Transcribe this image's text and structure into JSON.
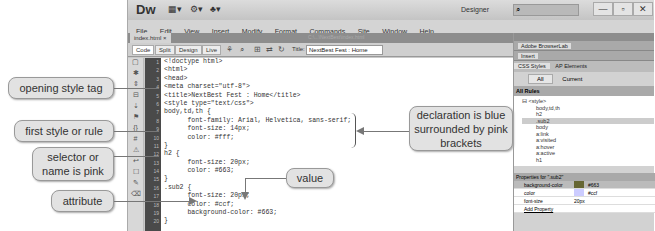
{
  "app": {
    "logo": "Dw",
    "workspace": "Designer",
    "search_placeholder": "",
    "window_controls": [
      "—",
      "▫",
      "✕"
    ]
  },
  "menu": [
    "File",
    "Edit",
    "View",
    "Insert",
    "Modify",
    "Format",
    "Commands",
    "Site",
    "Window",
    "Help"
  ],
  "document": {
    "tab": "index.html ×",
    "path": "C:\\...\\NextBest\\index.html",
    "views": [
      "Code",
      "Split",
      "Design",
      "Live"
    ],
    "title_label": "Title:",
    "title_value": "NextBest Fest : Home"
  },
  "code_lines": [
    "<!doctype html>",
    "<html>",
    "<head>",
    "<meta charset=\"utf-8\">",
    "<title>NextBest Fest : Home</title>",
    "<style type=\"text/css\">",
    "body,td,th {",
    "      font-family: Arial, Helvetica, sans-serif;",
    "      font-size: 14px;",
    "      color: #fff;",
    "}",
    "h2 {",
    "      font-size: 20px;",
    "      color: #663;",
    "}",
    ".sub2 {",
    "      font-size: 20px;",
    "      color: #ccf;",
    "      background-color: #663;",
    "}"
  ],
  "line_numbers": [
    "1",
    "2",
    "3",
    "4",
    "5",
    "6",
    "7",
    "8",
    "9",
    "10",
    "11",
    "12",
    "13",
    "14",
    "15",
    "16",
    "17",
    "18",
    "19",
    "20"
  ],
  "panels": {
    "browserlab": "Adobe BrowserLab",
    "insert": "Insert",
    "tabs": [
      "CSS Styles",
      "AP Elements"
    ],
    "mode_buttons": [
      "All",
      "Current"
    ],
    "rules_header": "All Rules",
    "rules": [
      "⊟ <style>",
      "body,td,th",
      "h2",
      ".sub2",
      "body",
      "a:link",
      "a:visited",
      "a:hover",
      "a:active",
      "h1"
    ],
    "props_header": "Properties for \".sub2\"",
    "props": [
      {
        "name": "background-color",
        "value": "#663",
        "swatch": "#666633"
      },
      {
        "name": "color",
        "value": "#ccf",
        "swatch": "#ccccff"
      },
      {
        "name": "font-size",
        "value": "20px",
        "swatch": ""
      },
      {
        "name": "Add Property",
        "value": "",
        "swatch": ""
      }
    ]
  },
  "callouts": {
    "opening_style_tag": "opening style tag",
    "first_style": "first style or rule",
    "selector": "selector or name is pink",
    "attribute": "attribute",
    "declaration": "declaration is blue surrounded by pink brackets",
    "value": "value"
  }
}
